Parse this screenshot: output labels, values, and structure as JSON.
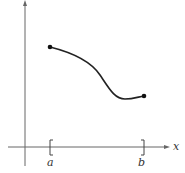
{
  "figure": {
    "axis_labels": {
      "x": "x"
    },
    "interval": {
      "left_label": "a",
      "right_label": "b"
    },
    "curve": {
      "description": "continuous function on closed interval [a, b] with endpoints marked",
      "start_point": [
        50,
        47
      ],
      "end_point": [
        144,
        96
      ]
    },
    "colors": {
      "axis": "#555555",
      "curve": "#222222",
      "text": "#333333"
    }
  }
}
